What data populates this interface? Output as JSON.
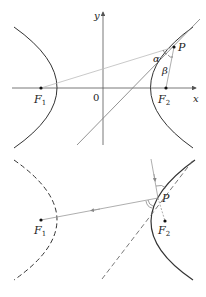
{
  "top_figure": {
    "axis_x_label": "x",
    "axis_y_label": "y",
    "origin_label": "0",
    "focus_1_label": "F",
    "focus_1_sub": "1",
    "focus_2_label": "F",
    "focus_2_sub": "2",
    "point_label": "P",
    "angle_alpha": "α",
    "angle_beta": "β"
  },
  "bottom_figure": {
    "focus_1_label": "F",
    "focus_1_sub": "1",
    "focus_2_label": "F",
    "focus_2_sub": "2",
    "point_label": "P"
  },
  "colors": {
    "curve": "#333333",
    "line": "#999999",
    "axis": "#555555"
  }
}
